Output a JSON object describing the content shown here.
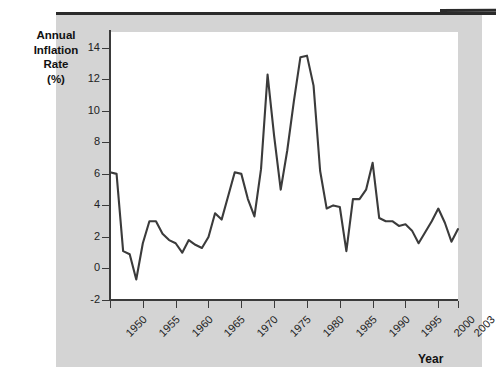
{
  "chart_data": {
    "type": "line",
    "title": "",
    "xlabel": "Year",
    "ylabel": "Annual Inflation Rate (%)",
    "ylabel_lines": [
      "Annual",
      "Inflation",
      "Rate",
      "(%)"
    ],
    "xlim": [
      1950,
      2003
    ],
    "ylim": [
      -2,
      15
    ],
    "grid": false,
    "legend": "none",
    "yticks": [
      -2,
      0,
      2,
      4,
      6,
      8,
      10,
      12,
      14
    ],
    "ytick_labels": [
      "-2",
      "0",
      "2",
      "4",
      "6",
      "8",
      "10",
      "12",
      "14"
    ],
    "xticks": [
      1950,
      1955,
      1960,
      1965,
      1970,
      1975,
      1980,
      1985,
      1990,
      1995,
      2000,
      2003
    ],
    "xtick_labels": [
      "1950",
      "1955",
      "1960",
      "1965",
      "1970",
      "1975",
      "1980",
      "1985",
      "1990",
      "1995",
      "2000",
      "2003"
    ],
    "series": [
      {
        "name": "Annual Inflation Rate",
        "color": "#3b3b3b",
        "x": [
          1950,
          1951,
          1952,
          1953,
          1954,
          1955,
          1956,
          1957,
          1958,
          1959,
          1960,
          1961,
          1962,
          1963,
          1964,
          1965,
          1966,
          1967,
          1968,
          1969,
          1970,
          1971,
          1972,
          1973,
          1974,
          1975,
          1976,
          1977,
          1978,
          1979,
          1980,
          1981,
          1982,
          1983,
          1984,
          1985,
          1986,
          1987,
          1988,
          1989,
          1990,
          1991,
          1992,
          1993,
          1994,
          1995,
          1996,
          1997,
          1998,
          1999,
          2000,
          2001,
          2002,
          2003
        ],
        "values": [
          6.1,
          6.0,
          1.1,
          0.9,
          -0.7,
          1.6,
          3.0,
          3.0,
          2.2,
          1.8,
          1.6,
          1.0,
          1.8,
          1.5,
          1.3,
          2.0,
          3.5,
          3.1,
          4.6,
          6.1,
          6.0,
          4.4,
          3.3,
          6.3,
          12.3,
          8.4,
          5.0,
          7.5,
          10.6,
          13.4,
          13.5,
          11.6,
          6.2,
          3.8,
          4.0,
          3.9,
          1.1,
          4.4,
          4.4,
          5.0,
          6.7,
          3.2,
          3.0,
          3.0,
          2.7,
          2.8,
          2.4,
          1.6,
          2.3,
          3.0,
          3.8,
          2.9,
          1.7,
          2.5
        ]
      }
    ]
  }
}
